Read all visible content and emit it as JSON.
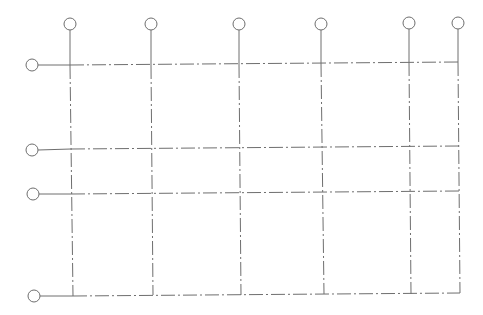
{
  "diagram": {
    "type": "structural-grid-plan",
    "colors": {
      "line": "#6e6e6e",
      "background": "#ffffff"
    },
    "bubble_radius": 6,
    "columns": [
      {
        "id": "col-1",
        "label": "",
        "bubble": [
          70,
          24
        ],
        "top": [
          70,
          65
        ],
        "bottom": [
          73,
          296
        ]
      },
      {
        "id": "col-2",
        "label": "",
        "bubble": [
          151,
          24
        ],
        "top": [
          151,
          65
        ],
        "bottom": [
          153,
          295
        ]
      },
      {
        "id": "col-3",
        "label": "",
        "bubble": [
          239,
          24
        ],
        "top": [
          239,
          64
        ],
        "bottom": [
          241,
          295
        ]
      },
      {
        "id": "col-4",
        "label": "",
        "bubble": [
          321,
          24
        ],
        "top": [
          321,
          63
        ],
        "bottom": [
          324,
          294
        ]
      },
      {
        "id": "col-5",
        "label": "",
        "bubble": [
          409,
          23
        ],
        "top": [
          409,
          62
        ],
        "bottom": [
          411,
          294
        ]
      },
      {
        "id": "col-6",
        "label": "",
        "bubble": [
          458,
          23
        ],
        "top": [
          458,
          62
        ],
        "bottom": [
          460,
          293
        ]
      }
    ],
    "rows": [
      {
        "id": "row-1",
        "label": "",
        "bubble": [
          32,
          65
        ],
        "left": [
          70,
          65
        ],
        "right": [
          458,
          62
        ]
      },
      {
        "id": "row-2",
        "label": "",
        "bubble": [
          32,
          150
        ],
        "left": [
          71,
          149
        ],
        "right": [
          459,
          146
        ]
      },
      {
        "id": "row-3",
        "label": "",
        "bubble": [
          33,
          194
        ],
        "left": [
          71,
          194
        ],
        "right": [
          459,
          191
        ]
      },
      {
        "id": "row-4",
        "label": "",
        "bubble": [
          34,
          296
        ],
        "left": [
          73,
          296
        ],
        "right": [
          460,
          293
        ]
      }
    ]
  }
}
